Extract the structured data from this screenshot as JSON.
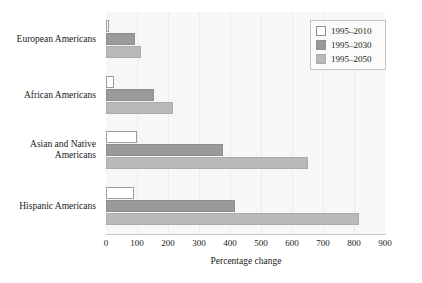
{
  "chart_data": {
    "type": "bar",
    "orientation": "horizontal",
    "title": "",
    "xlabel": "Percentage change",
    "ylabel": "",
    "xlim": [
      0,
      900
    ],
    "xticks": [
      0,
      100,
      200,
      300,
      400,
      500,
      600,
      700,
      800,
      900
    ],
    "xtick_labels": [
      "0",
      "100",
      "200",
      "300",
      "400",
      "500",
      "600",
      "700",
      "800",
      "900"
    ],
    "grid": true,
    "grid_axis": "x",
    "legend_position": "top-right",
    "categories": [
      "European Americans",
      "African Americans",
      "Asian and Native Americans",
      "Hispanic Americans"
    ],
    "series": [
      {
        "name": "1995–2010",
        "color": "#ffffff",
        "values": [
          10,
          25,
          100,
          90
        ]
      },
      {
        "name": "1995–2030",
        "color": "#9a9a9a",
        "values": [
          95,
          155,
          378,
          415
        ]
      },
      {
        "name": "1995–2050",
        "color": "#b9b9b9",
        "values": [
          112,
          215,
          652,
          815
        ]
      }
    ]
  },
  "legend": {
    "entries": [
      {
        "label": "1995–2010"
      },
      {
        "label": "1995–2030"
      },
      {
        "label": "1995–2050"
      }
    ]
  },
  "colors": {
    "plot_background": "#f7f7f7",
    "page_background": "#ffffff",
    "gridline": "#ebebeb",
    "axis_line": "#c9c9c9",
    "text": "#1a1a1a",
    "series_1995_2010": "#ffffff",
    "series_1995_2030": "#9a9a9a",
    "series_1995_2050": "#b9b9b9"
  }
}
